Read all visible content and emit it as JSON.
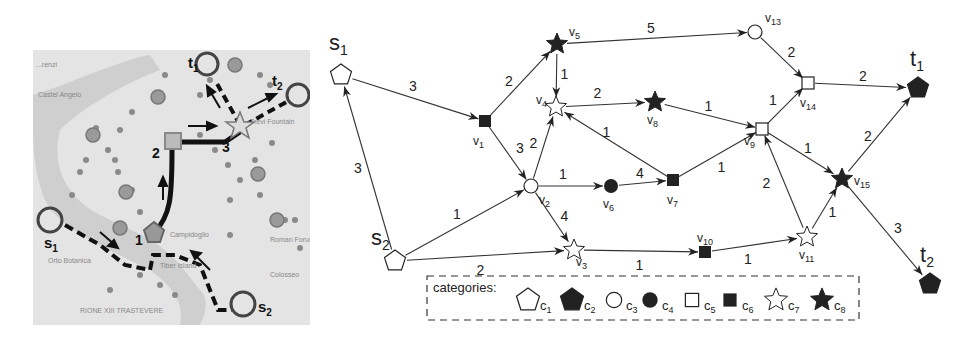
{
  "map": {
    "place_labels": [
      "...renzi",
      "Castel Angelo",
      "Trevi Fountain",
      "Campidoglio",
      "Roman Forum",
      "Orto Botanica",
      "Tiber Island",
      "Colosseo",
      "RIONE XIII TRASTEVERE"
    ],
    "route_marks": [
      "1",
      "2",
      "3"
    ],
    "sources": [
      {
        "label": "s",
        "sub": "1"
      },
      {
        "label": "s",
        "sub": "2"
      }
    ],
    "targets": [
      {
        "label": "t",
        "sub": "1"
      },
      {
        "label": "t",
        "sub": "2"
      }
    ]
  },
  "graph": {
    "nodes": [
      {
        "id": "s1",
        "label": "s",
        "sub": "1",
        "x": 341,
        "y": 75,
        "category": "c1"
      },
      {
        "id": "s2",
        "label": "s",
        "sub": "2",
        "x": 395,
        "y": 261,
        "category": "c1"
      },
      {
        "id": "v1",
        "label": "v",
        "sub": "1",
        "x": 485,
        "y": 121,
        "category": "c6"
      },
      {
        "id": "v2",
        "label": "v",
        "sub": "2",
        "x": 531,
        "y": 186,
        "category": "c3"
      },
      {
        "id": "v3",
        "label": "v",
        "sub": "3",
        "x": 574,
        "y": 250,
        "category": "c7"
      },
      {
        "id": "v4",
        "label": "v",
        "sub": "4",
        "x": 556,
        "y": 107,
        "category": "c7"
      },
      {
        "id": "v5",
        "label": "v",
        "sub": "5",
        "x": 557,
        "y": 44,
        "category": "c8"
      },
      {
        "id": "v6",
        "label": "v",
        "sub": "6",
        "x": 611,
        "y": 186,
        "category": "c4"
      },
      {
        "id": "v7",
        "label": "v",
        "sub": "7",
        "x": 673,
        "y": 180,
        "category": "c6"
      },
      {
        "id": "v8",
        "label": "v",
        "sub": "8",
        "x": 655,
        "y": 102,
        "category": "c8"
      },
      {
        "id": "v9",
        "label": "v",
        "sub": "9",
        "x": 762,
        "y": 129,
        "category": "c5"
      },
      {
        "id": "v10",
        "label": "v",
        "sub": "10",
        "x": 705,
        "y": 252,
        "category": "c6"
      },
      {
        "id": "v11",
        "label": "v",
        "sub": "11",
        "x": 807,
        "y": 237,
        "category": "c7"
      },
      {
        "id": "v13",
        "label": "v",
        "sub": "13",
        "x": 755,
        "y": 32,
        "category": "c3"
      },
      {
        "id": "v14",
        "label": "v",
        "sub": "14",
        "x": 808,
        "y": 83,
        "category": "c5"
      },
      {
        "id": "v15",
        "label": "v",
        "sub": "15",
        "x": 842,
        "y": 179,
        "category": "c8"
      },
      {
        "id": "t1",
        "label": "t",
        "sub": "1",
        "x": 918,
        "y": 88,
        "category": "c2"
      },
      {
        "id": "t2",
        "label": "t",
        "sub": "2",
        "x": 930,
        "y": 284,
        "category": "c2"
      }
    ],
    "edges": [
      {
        "from": "s1",
        "to": "v1",
        "weight": "3"
      },
      {
        "from": "s2",
        "to": "s1",
        "weight": "3"
      },
      {
        "from": "s2",
        "to": "v2",
        "weight": "1"
      },
      {
        "from": "s2",
        "to": "v3",
        "weight": "2"
      },
      {
        "from": "v1",
        "to": "v5",
        "weight": "2"
      },
      {
        "from": "v1",
        "to": "v2",
        "weight": "3"
      },
      {
        "from": "v5",
        "to": "v4",
        "weight": "1"
      },
      {
        "from": "v5",
        "to": "v13",
        "weight": "5"
      },
      {
        "from": "v2",
        "to": "v4",
        "weight": "2"
      },
      {
        "from": "v2",
        "to": "v6",
        "weight": "1"
      },
      {
        "from": "v2",
        "to": "v3",
        "weight": "4"
      },
      {
        "from": "v4",
        "to": "v8",
        "weight": "2"
      },
      {
        "from": "v6",
        "to": "v7",
        "weight": "4"
      },
      {
        "from": "v7",
        "to": "v4",
        "weight": "1"
      },
      {
        "from": "v7",
        "to": "v9",
        "weight": "1"
      },
      {
        "from": "v8",
        "to": "v9",
        "weight": "1"
      },
      {
        "from": "v9",
        "to": "v14",
        "weight": "1"
      },
      {
        "from": "v9",
        "to": "v15",
        "weight": "1"
      },
      {
        "from": "v11",
        "to": "v9",
        "weight": "2"
      },
      {
        "from": "v3",
        "to": "v10",
        "weight": "1"
      },
      {
        "from": "v10",
        "to": "v11",
        "weight": "1"
      },
      {
        "from": "v11",
        "to": "v15",
        "weight": "1"
      },
      {
        "from": "v13",
        "to": "v14",
        "weight": "2"
      },
      {
        "from": "v14",
        "to": "t1",
        "weight": "2"
      },
      {
        "from": "v15",
        "to": "t1",
        "weight": "2"
      },
      {
        "from": "v15",
        "to": "t2",
        "weight": "3"
      }
    ]
  },
  "legend": {
    "title": "categories:",
    "items": [
      {
        "id": "c1",
        "label": "c",
        "sub": "1",
        "shape": "pentagon-outline"
      },
      {
        "id": "c2",
        "label": "c",
        "sub": "2",
        "shape": "pentagon-filled"
      },
      {
        "id": "c3",
        "label": "c",
        "sub": "3",
        "shape": "circle-outline"
      },
      {
        "id": "c4",
        "label": "c",
        "sub": "4",
        "shape": "circle-filled"
      },
      {
        "id": "c5",
        "label": "c",
        "sub": "5",
        "shape": "square-outline"
      },
      {
        "id": "c6",
        "label": "c",
        "sub": "6",
        "shape": "square-filled"
      },
      {
        "id": "c7",
        "label": "c",
        "sub": "7",
        "shape": "star-outline"
      },
      {
        "id": "c8",
        "label": "c",
        "sub": "8",
        "shape": "star-filled"
      }
    ]
  },
  "colors": {
    "ink": "#222222",
    "map_bg": "#e4e4e4",
    "map_poi": "#8a8a8a"
  }
}
